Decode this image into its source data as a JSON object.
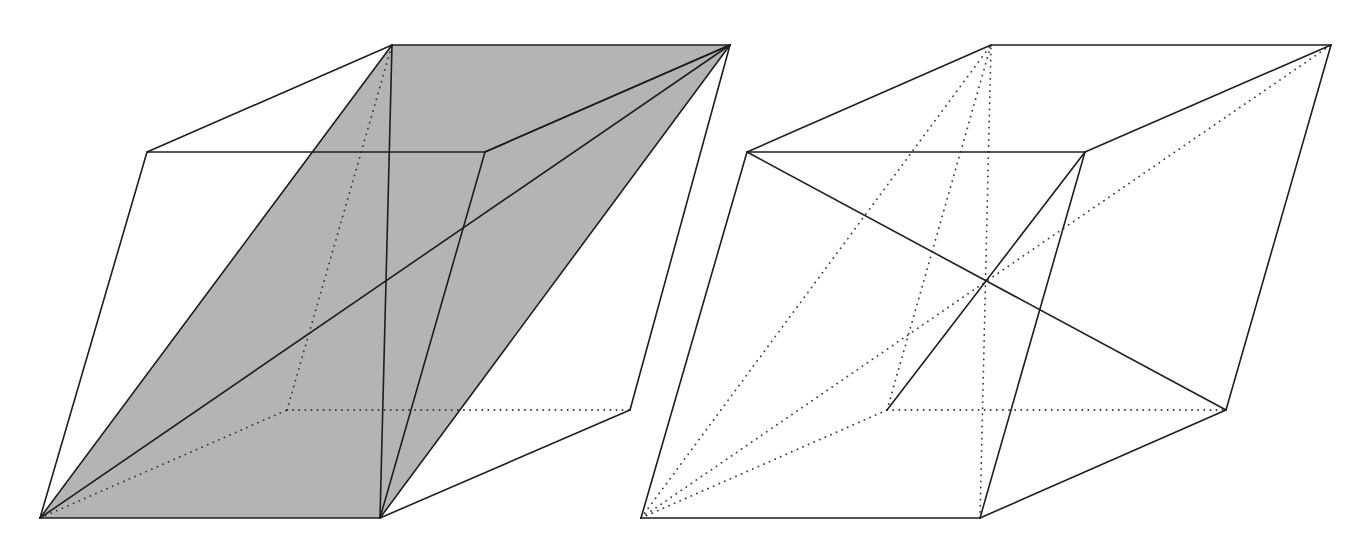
{
  "diagram": {
    "type": "geometry",
    "colors": {
      "background": "#ffffff",
      "line": "#1e1e1e",
      "hidden_line": "#3a3a3a",
      "section_fill": "#b4b4b4"
    },
    "figures": [
      {
        "id": "left-parallelepiped",
        "vertices": {
          "A": [
            40,
            518
          ],
          "B": [
            380,
            518
          ],
          "C": [
            630,
            410
          ],
          "D": [
            287,
            410
          ],
          "E": [
            147,
            152
          ],
          "F": [
            485,
            152
          ],
          "G": [
            730,
            45
          ],
          "H": [
            392,
            45
          ]
        },
        "shaded_section": [
          "A",
          "B",
          "G",
          "H"
        ],
        "visible_edges": [
          [
            "A",
            "B"
          ],
          [
            "B",
            "C"
          ],
          [
            "C",
            "G"
          ],
          [
            "A",
            "E"
          ],
          [
            "E",
            "F"
          ],
          [
            "F",
            "B"
          ],
          [
            "F",
            "G"
          ],
          [
            "E",
            "H"
          ],
          [
            "H",
            "G"
          ]
        ],
        "hidden_edges": [
          [
            "A",
            "D"
          ],
          [
            "D",
            "C"
          ],
          [
            "D",
            "H"
          ]
        ],
        "visible_diagonals": [
          [
            "A",
            "G"
          ],
          [
            "B",
            "G"
          ],
          [
            "B",
            "H"
          ],
          [
            "A",
            "H"
          ],
          [
            "F",
            "G"
          ]
        ],
        "hidden_diagonals": []
      },
      {
        "id": "right-parallelepiped",
        "vertices": {
          "A": [
            641,
            518
          ],
          "B": [
            980,
            518
          ],
          "C": [
            1226,
            410
          ],
          "D": [
            887,
            410
          ],
          "E": [
            747,
            152
          ],
          "F": [
            1085,
            152
          ],
          "G": [
            1331,
            45
          ],
          "H": [
            991,
            45
          ]
        },
        "visible_edges": [
          [
            "A",
            "B"
          ],
          [
            "B",
            "C"
          ],
          [
            "C",
            "G"
          ],
          [
            "A",
            "E"
          ],
          [
            "E",
            "F"
          ],
          [
            "F",
            "B"
          ],
          [
            "F",
            "G"
          ],
          [
            "E",
            "H"
          ],
          [
            "H",
            "G"
          ]
        ],
        "hidden_edges": [
          [
            "A",
            "D"
          ],
          [
            "D",
            "C"
          ],
          [
            "D",
            "H"
          ]
        ],
        "visible_diagonals": [
          [
            "E",
            "C"
          ],
          [
            "D",
            "F"
          ]
        ],
        "hidden_diagonals": [
          [
            "A",
            "G"
          ],
          [
            "B",
            "H"
          ],
          [
            "A",
            "H"
          ]
        ]
      }
    ]
  }
}
